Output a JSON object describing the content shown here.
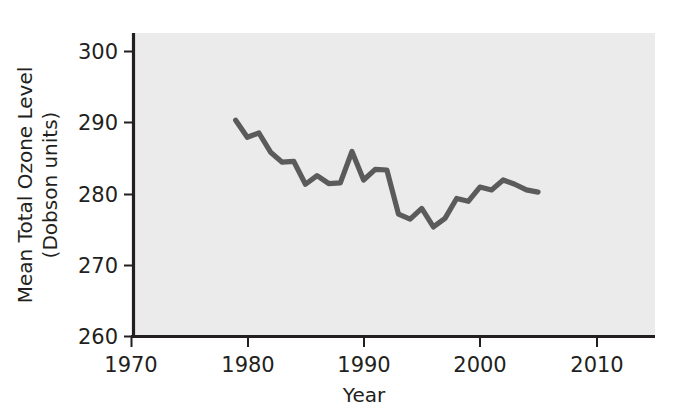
{
  "chart_data": {
    "type": "line",
    "title": "",
    "xlabel": "Year",
    "ylabel": "Mean Total Ozone Level (Dobson units)",
    "ylabel_line1": "Mean Total Ozone Level",
    "ylabel_line2": "(Dobson units)",
    "xlim": [
      1970,
      2012
    ],
    "ylim": [
      260,
      302
    ],
    "xticks": [
      1970,
      1980,
      1990,
      2000,
      2010
    ],
    "yticks": [
      260,
      270,
      280,
      290,
      300
    ],
    "xtick_labels": [
      "1970",
      "1980",
      "1990",
      "2000",
      "2010"
    ],
    "ytick_labels": [
      "260",
      "270",
      "280",
      "290",
      "300"
    ],
    "grid": false,
    "legend": "none",
    "line_color": "#5b5b5b",
    "plot_background": "#ebebeb",
    "axis_color": "#231f20",
    "x": [
      1979,
      1980,
      1981,
      1982,
      1983,
      1984,
      1985,
      1986,
      1987,
      1988,
      1989,
      1990,
      1991,
      1992,
      1993,
      1994,
      1995,
      1996,
      1997,
      1998,
      1999,
      2000,
      2001,
      2002,
      2003,
      2004,
      2005
    ],
    "values": [
      290.4,
      288.0,
      288.6,
      285.9,
      284.5,
      284.6,
      281.4,
      282.6,
      281.5,
      281.6,
      286.0,
      282.0,
      283.5,
      283.4,
      277.2,
      276.5,
      278.0,
      275.4,
      276.6,
      279.4,
      279.0,
      281.0,
      280.6,
      282.0,
      281.4,
      280.6,
      280.3
    ],
    "series": [
      {
        "name": "Mean Total Ozone Level",
        "values": [
          290.4,
          288.0,
          288.6,
          285.9,
          284.5,
          284.6,
          281.4,
          282.6,
          281.5,
          281.6,
          286.0,
          282.0,
          283.5,
          283.4,
          277.2,
          276.5,
          278.0,
          275.4,
          276.6,
          279.4,
          279.0,
          281.0,
          280.6,
          282.0,
          281.4,
          280.6,
          280.3
        ]
      }
    ]
  },
  "axes": {
    "x_title": "Year",
    "y_title_line1": "Mean Total Ozone Level",
    "y_title_line2": "(Dobson units)"
  },
  "ticks": {
    "y": [
      "300",
      "290",
      "280",
      "270",
      "260"
    ],
    "x": [
      "1970",
      "1980",
      "1990",
      "2000",
      "2010"
    ]
  }
}
